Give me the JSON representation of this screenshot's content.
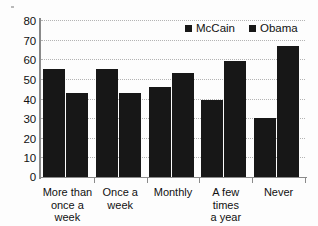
{
  "chart_data": {
    "type": "bar",
    "title": "",
    "subtitle": "",
    "xlabel": "",
    "ylabel": "",
    "ylim": [
      0,
      80
    ],
    "ytick_step": 10,
    "yticks": [
      80,
      70,
      60,
      50,
      40,
      30,
      20,
      10,
      0
    ],
    "grid": true,
    "grid_style": "dotted-horizontal",
    "legend_position": "top-right",
    "categories": [
      "More than once a week",
      "Once a week",
      "Monthly",
      "A few times a year",
      "Never"
    ],
    "category_lines": [
      [
        "More than",
        "once a week"
      ],
      [
        "Once a",
        "week"
      ],
      [
        "Monthly",
        ""
      ],
      [
        "A few times",
        "a year"
      ],
      [
        "Never",
        ""
      ]
    ],
    "series": [
      {
        "name": "McCain",
        "color": "#171717",
        "values": [
          55,
          55,
          46,
          39,
          30
        ]
      },
      {
        "name": "Obama",
        "color": "#171717",
        "values": [
          43,
          43,
          53,
          59,
          67
        ]
      }
    ]
  },
  "legend": {
    "items": [
      {
        "label": "McCain",
        "color": "#171717"
      },
      {
        "label": "Obama",
        "color": "#171717"
      }
    ]
  },
  "axis": {
    "y_labels": [
      "80",
      "70",
      "60",
      "50",
      "40",
      "30",
      "20",
      "10",
      "0"
    ]
  }
}
